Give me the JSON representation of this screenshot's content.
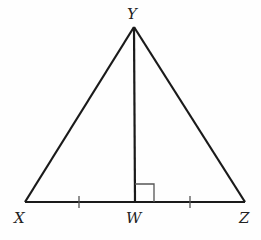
{
  "diagram": {
    "type": "geometry-triangle",
    "vertices": {
      "X": {
        "label": "X",
        "x": 25,
        "y": 202
      },
      "Y": {
        "label": "Y",
        "x": 134,
        "y": 27
      },
      "Z": {
        "label": "Z",
        "x": 245,
        "y": 202
      },
      "W": {
        "label": "W",
        "x": 135,
        "y": 202
      }
    },
    "segments": [
      "XY",
      "YZ",
      "XZ",
      "YW"
    ],
    "marks": {
      "right_angle_at": "W",
      "congruent_ticks": [
        "XW",
        "WZ"
      ]
    },
    "colors": {
      "stroke": "#1a1a1a",
      "mark": "#555555",
      "background": "#fefefe"
    }
  }
}
